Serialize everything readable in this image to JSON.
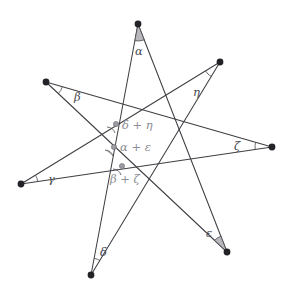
{
  "figure": {
    "width": 290,
    "height": 298,
    "background_color": "#ffffff",
    "line_color": "#3f3f44",
    "vertex_dot_color": "#232327",
    "inner_dot_color": "#9a9aa0",
    "wedge_fill_color": "#b9b9bd",
    "label_color": "#4a4a50",
    "sum_label_color": "#8d8d93"
  },
  "chart_data": {
    "type": "diagram",
    "subtype": "star-polygon",
    "schlafli": "{7/3}",
    "point_count": 7,
    "outer_points": [
      {
        "id": "alpha",
        "label": "α",
        "x": 138,
        "y": 24,
        "label_x": 135,
        "label_y": 46,
        "wedge": "filled"
      },
      {
        "id": "beta",
        "label": "β",
        "x": 46,
        "y": 82,
        "label_x": 74,
        "label_y": 92,
        "wedge": "open"
      },
      {
        "id": "gamma",
        "label": "γ",
        "x": 21,
        "y": 184,
        "label_x": 48,
        "label_y": 174,
        "wedge": "open"
      },
      {
        "id": "delta",
        "label": "δ",
        "x": 91,
        "y": 275,
        "label_x": 100,
        "label_y": 247,
        "wedge": "open"
      },
      {
        "id": "epsilon",
        "label": "ε",
        "x": 227,
        "y": 252,
        "label_x": 206,
        "label_y": 228,
        "wedge": "filled"
      },
      {
        "id": "zeta",
        "label": "ζ",
        "x": 272,
        "y": 147,
        "label_x": 234,
        "label_y": 141,
        "wedge": "open"
      },
      {
        "id": "eta",
        "label": "η",
        "x": 220,
        "y": 62,
        "label_x": 193,
        "label_y": 87,
        "wedge": "open"
      }
    ],
    "interior_sum_labels": [
      {
        "id": "delta-plus-eta",
        "text": "δ + η",
        "x": 122,
        "y": 120,
        "wedge": "open",
        "wedge_x": 116,
        "wedge_y": 124
      },
      {
        "id": "alpha-plus-eps",
        "text": "α + ε",
        "x": 120,
        "y": 142,
        "wedge": "filled",
        "wedge_x": 114,
        "wedge_y": 147
      },
      {
        "id": "beta-plus-zeta",
        "text": "β + ζ",
        "x": 110,
        "y": 174,
        "wedge": "open",
        "wedge_x": 122,
        "wedge_y": 166
      }
    ],
    "edges_description": "Each outer point connects to the third point around the circle, forming a continuous {7/3} heptagram.",
    "xlabel": "",
    "ylabel": "",
    "grid": false,
    "legend": "none"
  }
}
